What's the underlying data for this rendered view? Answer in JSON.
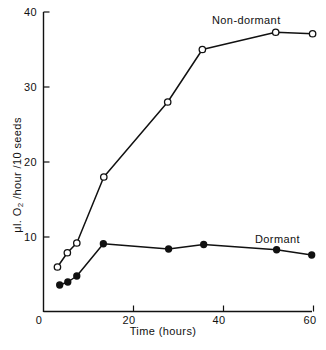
{
  "chart_data": {
    "type": "line",
    "title": "",
    "xlabel": "Time (hours)",
    "ylabel": "μl. O2 /hour /10 seeds",
    "ylabel_parts": {
      "prefix": "μl. O",
      "subscript": "2",
      "suffix": " /hour /10 seeds"
    },
    "xlim": [
      0,
      62
    ],
    "ylim": [
      0,
      40
    ],
    "xticks": [
      0,
      20,
      40,
      60
    ],
    "xtick_labels": [
      "0",
      "20",
      "40",
      "60"
    ],
    "yticks": [
      10,
      20,
      30,
      40
    ],
    "ytick_labels": [
      "10",
      "20",
      "30",
      "40"
    ],
    "grid": false,
    "legend_position": "inline-annotations",
    "series": [
      {
        "name": "Non-dormant",
        "marker": "open-circle",
        "color": "#111111",
        "annotation": "Non-dormant",
        "points": [
          {
            "x": 3.1,
            "y": 6.0
          },
          {
            "x": 5.3,
            "y": 7.9
          },
          {
            "x": 7.4,
            "y": 9.2
          },
          {
            "x": 13.4,
            "y": 18.0
          },
          {
            "x": 27.6,
            "y": 28.0
          },
          {
            "x": 35.3,
            "y": 35.0
          },
          {
            "x": 51.6,
            "y": 37.3
          },
          {
            "x": 59.8,
            "y": 37.1
          }
        ]
      },
      {
        "name": "Dormant",
        "marker": "filled-circle",
        "color": "#111111",
        "annotation": "Dormant",
        "points": [
          {
            "x": 3.6,
            "y": 3.6
          },
          {
            "x": 5.4,
            "y": 4.0
          },
          {
            "x": 7.4,
            "y": 4.8
          },
          {
            "x": 13.3,
            "y": 9.1
          },
          {
            "x": 27.8,
            "y": 8.4
          },
          {
            "x": 35.6,
            "y": 9.0
          },
          {
            "x": 51.8,
            "y": 8.3
          },
          {
            "x": 59.6,
            "y": 7.6
          }
        ]
      }
    ]
  },
  "axes": {
    "x_title": "Time (hours)",
    "y_title_prefix": "μl. O",
    "y_title_subscript": "2",
    "y_title_suffix": " /hour /10 seeds",
    "x_tick_labels": [
      "0",
      "20",
      "40",
      "60"
    ],
    "y_tick_labels": [
      "10",
      "20",
      "30",
      "40"
    ]
  },
  "annotations": {
    "non_dormant": "Non-dormant",
    "dormant": "Dormant"
  },
  "colors": {
    "ink": "#111111",
    "background": "#ffffff",
    "marker_fill_open": "#ffffff"
  }
}
